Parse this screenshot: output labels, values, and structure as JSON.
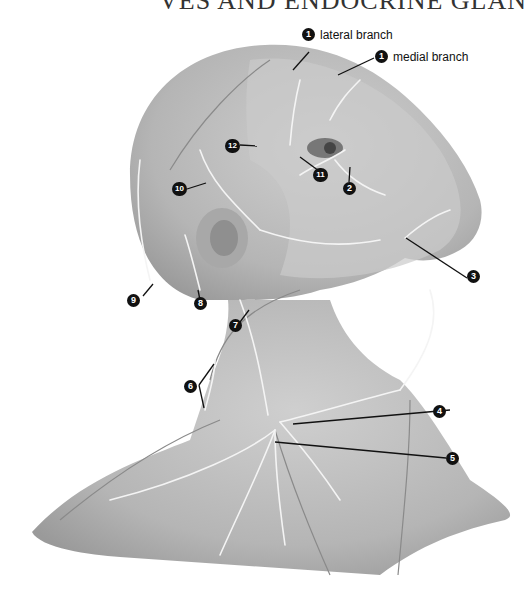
{
  "page_title_fragment": "VES AND ENDOCRINE GLAN",
  "illustration": {
    "subject": "Cutaneous nerves of head and neck",
    "labels": [
      {
        "num": "1",
        "text": "lateral branch"
      },
      {
        "num": "1",
        "text": "medial branch"
      },
      {
        "num": "2",
        "text": ""
      },
      {
        "num": "3",
        "text": ""
      },
      {
        "num": "4",
        "text": ""
      },
      {
        "num": "5",
        "text": ""
      },
      {
        "num": "6",
        "text": ""
      },
      {
        "num": "7",
        "text": ""
      },
      {
        "num": "8",
        "text": ""
      },
      {
        "num": "9",
        "text": ""
      },
      {
        "num": "10",
        "text": ""
      },
      {
        "num": "11",
        "text": ""
      },
      {
        "num": "12",
        "text": ""
      }
    ]
  },
  "colors": {
    "skin": "#bdbdbd",
    "skin_dark": "#9e9e9e",
    "nerve": "#f4f4f4",
    "leader": "#111111"
  }
}
